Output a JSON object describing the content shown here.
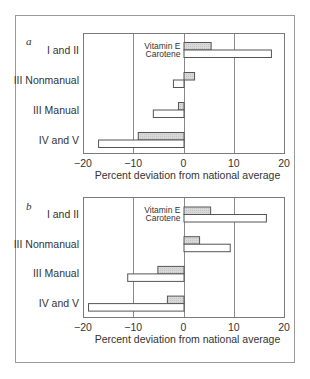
{
  "chart_data": [
    {
      "panel": "a",
      "type": "bar",
      "orientation": "horizontal",
      "title": "",
      "categories": [
        "I and II",
        "III Nonmanual",
        "III Manual",
        "IV and V"
      ],
      "series": [
        {
          "name": "Vitamin E",
          "values": [
            5.4,
            2.1,
            -1.1,
            -9.1
          ],
          "fill": "#d6d6d6"
        },
        {
          "name": "Carotene",
          "values": [
            17.4,
            -2.1,
            -6.1,
            -17.0
          ],
          "fill": "#ffffff"
        }
      ],
      "xlabel": "Percent deviation from national average",
      "ylabel": "",
      "xlim": [
        -20,
        20
      ],
      "xticks": [
        -20,
        -10,
        0,
        10,
        20
      ],
      "xtick_labels": [
        "−20",
        "−10",
        "0",
        "10",
        "20"
      ],
      "grid": "vertical lines at -10, 0, 10",
      "legend": {
        "position": "inside, left of zero line beside first group",
        "entries": [
          "Vitamin E",
          "Carotene"
        ]
      }
    },
    {
      "panel": "b",
      "type": "bar",
      "orientation": "horizontal",
      "title": "",
      "categories": [
        "I and II",
        "III Nonmanual",
        "III Manual",
        "IV and V"
      ],
      "series": [
        {
          "name": "Vitamin E",
          "values": [
            5.3,
            3.1,
            -5.2,
            -3.3
          ],
          "fill": "#d6d6d6"
        },
        {
          "name": "Carotene",
          "values": [
            16.4,
            9.2,
            -11.2,
            -19.0
          ],
          "fill": "#ffffff"
        }
      ],
      "xlabel": "Percent deviation from national average",
      "ylabel": "",
      "xlim": [
        -20,
        20
      ],
      "xticks": [
        -20,
        -10,
        0,
        10,
        20
      ],
      "xtick_labels": [
        "−20",
        "−10",
        "0",
        "10",
        "20"
      ],
      "grid": "vertical lines at -10, 0, 10",
      "legend": {
        "position": "inside, left of zero line beside first group",
        "entries": [
          "Vitamin E",
          "Carotene"
        ]
      }
    }
  ],
  "panels": [
    {
      "letter": "a",
      "legend": {
        "vitamin_e": "Vitamin E",
        "carotene": "Carotene"
      },
      "xlabel": "Percent deviation from national average"
    },
    {
      "letter": "b",
      "legend": {
        "vitamin_e": "Vitamin E",
        "carotene": "Carotene"
      },
      "xlabel": "Percent deviation from national average"
    }
  ],
  "colors": {
    "frame": "#9a9a9a",
    "axis": "#7a7a7a",
    "grid": "#8a8a8a",
    "bar_stroke": "#555555",
    "vitamin_e_fill": "#d6d6d6",
    "carotene_fill": "#ffffff",
    "text": "#333333"
  }
}
